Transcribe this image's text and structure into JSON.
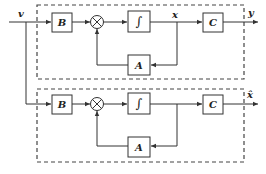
{
  "diagram": {
    "type": "block-diagram",
    "input": {
      "label": "v"
    },
    "systems": [
      {
        "name": "plant",
        "blocks": {
          "input_gain": "B",
          "integrator": "∫",
          "feedback": "A",
          "output_gain": "C"
        },
        "state_label": "x",
        "output_label": "y"
      },
      {
        "name": "observer",
        "blocks": {
          "input_gain": "B",
          "integrator": "∫",
          "feedback": "A",
          "output_gain": "C"
        },
        "state_label": "",
        "output_label": "x̂"
      }
    ],
    "summing_junction_symbol": "⊗",
    "colors": {
      "line": "#333333",
      "background": "#ffffff"
    }
  }
}
